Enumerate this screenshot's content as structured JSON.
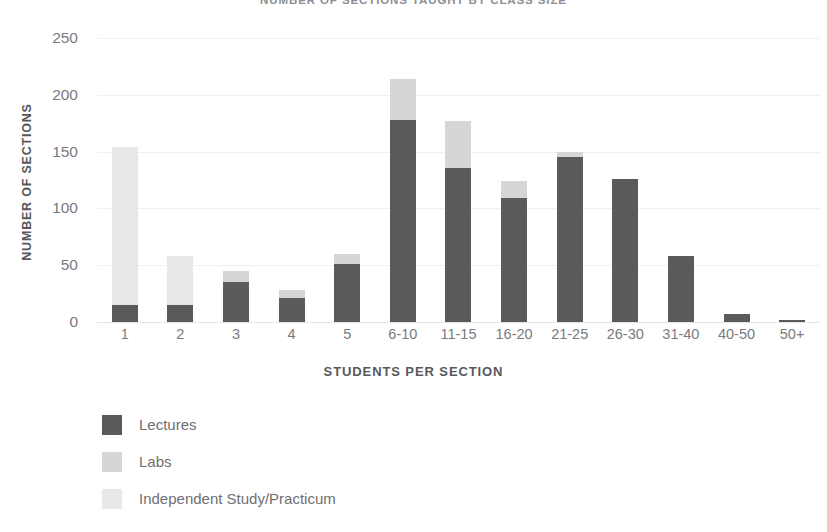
{
  "chart_data": {
    "type": "bar",
    "subtype": "stacked-vertical",
    "title": "NUMBER OF SECTIONS TAUGHT BY CLASS SIZE",
    "xlabel": "STUDENTS PER SECTION",
    "ylabel": "NUMBER OF SECTIONS",
    "ylim": [
      0,
      250
    ],
    "yticks": [
      0,
      50,
      100,
      150,
      200,
      250
    ],
    "ytick_labels": [
      "0",
      "50",
      "100",
      "150",
      "200",
      "250"
    ],
    "grid": true,
    "legend_position": "bottom-left",
    "categories": [
      "1",
      "2",
      "3",
      "4",
      "5",
      "6-10",
      "11-15",
      "16-20",
      "21-25",
      "26-30",
      "31-40",
      "40-50",
      "50+"
    ],
    "series": [
      {
        "name": "Lectures",
        "color": "#5a5a5c",
        "values": [
          15,
          15,
          35,
          21,
          51,
          178,
          136,
          109,
          145,
          126,
          58,
          7,
          2
        ]
      },
      {
        "name": "Labs",
        "color": "#d6d6d8",
        "values": [
          0,
          0,
          10,
          7,
          9,
          36,
          41,
          15,
          5,
          0,
          0,
          0,
          0
        ]
      },
      {
        "name": "Independent Study/Practicum",
        "color": "#e8e8ea",
        "values": [
          139,
          43,
          0,
          0,
          0,
          0,
          0,
          0,
          0,
          0,
          0,
          0,
          0
        ]
      }
    ],
    "totals": [
      154,
      58,
      45,
      28,
      60,
      214,
      177,
      124,
      150,
      126,
      58,
      7,
      2
    ]
  },
  "colors": {
    "lectures": "#5a5a5c",
    "labs": "#d6d6d8",
    "independent_study": "#e8e8ea",
    "gridline": "#f0f0f2",
    "baseline": "#e4e4e6",
    "axis_text": "#7a7a7e",
    "axis_title": "#58585c",
    "title": "#8e8e94",
    "background": "#ffffff"
  }
}
